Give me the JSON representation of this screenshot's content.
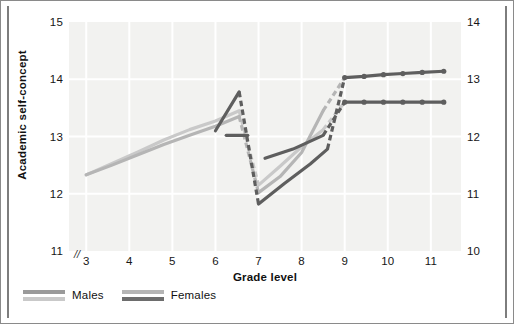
{
  "chart_data": {
    "type": "line",
    "title": "",
    "xlabel": "Grade level",
    "ylabel": "Academic self-concept",
    "xlim": [
      2.6,
      11.7
    ],
    "ylim_left": [
      11,
      15
    ],
    "ylim_right": [
      10,
      14
    ],
    "ytick_labels_left": [
      "15",
      "14",
      "13",
      "12",
      "11"
    ],
    "ytick_values_left": [
      15,
      14,
      13,
      12,
      11
    ],
    "ytick_labels_right": [
      "14",
      "13",
      "12",
      "11",
      "10"
    ],
    "ytick_values_right": [
      14,
      13,
      12,
      11,
      10
    ],
    "xtick_labels": [
      "3",
      "4",
      "5",
      "6",
      "7",
      "8",
      "9",
      "10",
      "11"
    ],
    "xtick_values": [
      3,
      4,
      5,
      6,
      7,
      8,
      9,
      10,
      11
    ],
    "axis_break_marker": "//",
    "grid": true,
    "grid_color": "#ffffff",
    "plot_background": "#f2f2f0",
    "legend_position": "below-plot-left",
    "legend": [
      {
        "label": "Males",
        "colors": [
          "#9a9a9a",
          "#c9c9c9"
        ]
      },
      {
        "label": "Females",
        "colors": [
          "#b5b5b5",
          "#6d6d6d"
        ]
      }
    ],
    "colors": {
      "males_light": "#c9c9c9",
      "males_mid": "#9a9a9a",
      "females_mid": "#b5b5b5",
      "females_dark": "#6d6d6d",
      "dark_cohort": "#5e5e5e",
      "axis_text": "#161616"
    },
    "series": [
      {
        "name": "Males cohort 1 (elementary)",
        "color": "#c9c9c9",
        "style": "solid",
        "points": [
          [
            3.0,
            12.33
          ],
          [
            3.6,
            12.53
          ],
          [
            4.2,
            12.73
          ],
          [
            4.8,
            12.94
          ],
          [
            5.4,
            13.12
          ],
          [
            6.0,
            13.27
          ],
          [
            6.55,
            13.45
          ]
        ]
      },
      {
        "name": "Males cohort 1 transition (elementary to middle)",
        "color": "#c9c9c9",
        "style": "dashed",
        "points": [
          [
            6.55,
            13.45
          ],
          [
            7.0,
            12.15
          ]
        ]
      },
      {
        "name": "Males cohort 2 (middle school)",
        "color": "#c9c9c9",
        "style": "solid",
        "points": [
          [
            7.0,
            12.15
          ],
          [
            7.5,
            12.48
          ],
          [
            8.0,
            12.82
          ],
          [
            8.5,
            13.12
          ]
        ]
      },
      {
        "name": "Males cohort 2 transition (middle to high)",
        "color": "#c9c9c9",
        "style": "dashed",
        "points": [
          [
            8.5,
            13.12
          ],
          [
            9.0,
            13.6
          ]
        ]
      },
      {
        "name": "Females cohort 1 (elementary)",
        "color": "#b5b5b5",
        "style": "solid",
        "points": [
          [
            3.0,
            12.33
          ],
          [
            3.6,
            12.5
          ],
          [
            4.2,
            12.68
          ],
          [
            4.8,
            12.86
          ],
          [
            5.4,
            13.02
          ],
          [
            6.0,
            13.18
          ],
          [
            6.55,
            13.35
          ]
        ]
      },
      {
        "name": "Females cohort 1 transition (elementary to middle)",
        "color": "#b5b5b5",
        "style": "dashed",
        "points": [
          [
            6.55,
            13.35
          ],
          [
            7.0,
            12.02
          ]
        ]
      },
      {
        "name": "Females cohort 2 (middle school)",
        "color": "#b5b5b5",
        "style": "solid",
        "points": [
          [
            7.0,
            12.02
          ],
          [
            7.5,
            12.3
          ],
          [
            8.0,
            12.72
          ],
          [
            8.5,
            13.45
          ]
        ]
      },
      {
        "name": "Females cohort 2 transition (middle to high)",
        "color": "#b5b5b5",
        "style": "dashed",
        "points": [
          [
            8.5,
            13.45
          ],
          [
            9.0,
            14.03
          ]
        ]
      },
      {
        "name": "Males cohort 3 peak (late elementary)",
        "color": "#5e5e5e",
        "style": "solid",
        "points": [
          [
            6.0,
            13.1
          ],
          [
            6.55,
            13.78
          ]
        ]
      },
      {
        "name": "Males cohort 3 transition",
        "color": "#5e5e5e",
        "style": "dashed",
        "points": [
          [
            6.55,
            13.78
          ],
          [
            7.0,
            11.82
          ]
        ]
      },
      {
        "name": "Males cohort 3 (middle school)",
        "color": "#5e5e5e",
        "style": "solid",
        "points": [
          [
            7.0,
            11.82
          ],
          [
            7.6,
            12.18
          ],
          [
            8.2,
            12.52
          ],
          [
            8.6,
            12.78
          ]
        ]
      },
      {
        "name": "Males cohort 3 transition to high school",
        "color": "#5e5e5e",
        "style": "dashed",
        "points": [
          [
            8.6,
            12.78
          ],
          [
            9.0,
            14.03
          ]
        ]
      },
      {
        "name": "Females cohort 3 (late elementary flat)",
        "color": "#5e5e5e",
        "style": "solid",
        "points": [
          [
            6.25,
            13.02
          ],
          [
            6.75,
            13.02
          ]
        ]
      },
      {
        "name": "Females cohort 3 (middle school)",
        "color": "#5e5e5e",
        "style": "solid",
        "points": [
          [
            7.15,
            12.62
          ],
          [
            7.8,
            12.78
          ],
          [
            8.5,
            13.02
          ]
        ]
      },
      {
        "name": "Females cohort 3 transition to high school",
        "color": "#5e5e5e",
        "style": "dashed",
        "points": [
          [
            8.5,
            13.02
          ],
          [
            9.0,
            13.6
          ]
        ]
      },
      {
        "name": "Males high school plateau",
        "color": "#5e5e5e",
        "style": "solid",
        "markers": true,
        "points": [
          [
            9.0,
            14.03
          ],
          [
            9.45,
            14.05
          ],
          [
            9.9,
            14.08
          ],
          [
            10.35,
            14.1
          ],
          [
            10.8,
            14.12
          ],
          [
            11.3,
            14.14
          ]
        ]
      },
      {
        "name": "Females high school plateau",
        "color": "#5e5e5e",
        "style": "solid",
        "markers": true,
        "points": [
          [
            9.0,
            13.6
          ],
          [
            9.45,
            13.6
          ],
          [
            9.9,
            13.6
          ],
          [
            10.35,
            13.6
          ],
          [
            10.8,
            13.6
          ],
          [
            11.3,
            13.6
          ]
        ]
      }
    ]
  }
}
